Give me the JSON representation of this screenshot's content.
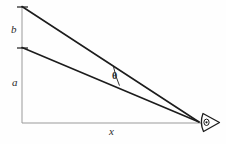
{
  "figure": {
    "kind": "geometry-diagram",
    "background_color": "#fefefe",
    "stroke_color": "#1c1c1c",
    "axis_color": "#8a8a8a",
    "labels": {
      "height_upper": "b",
      "height_lower": "a",
      "horizontal_distance": "x",
      "angle": "θ"
    },
    "icons": {
      "eye": "eye-icon"
    },
    "geometry": {
      "origin": {
        "x": 22,
        "y": 123
      },
      "eye_point": {
        "x": 200,
        "y": 122
      },
      "upper_point": {
        "x": 22,
        "y": 7
      },
      "lower_point": {
        "x": 22,
        "y": 48
      },
      "vertical_axis": {
        "x": 22,
        "y_top": 7,
        "y_bottom": 123
      },
      "horizontal_axis": {
        "y": 123,
        "x_left": 22,
        "x_right": 200
      },
      "angle_arc_center": {
        "x": 200,
        "y": 122
      },
      "angle_arc_radius": 92
    },
    "segments": [
      {
        "name": "sight-line-upper",
        "from": [
          22,
          7
        ],
        "to": [
          200,
          122
        ]
      },
      {
        "name": "sight-line-lower",
        "from": [
          22,
          48
        ],
        "to": [
          200,
          122
        ]
      }
    ],
    "ticks": [
      {
        "name": "tick-upper",
        "x": 22,
        "y": 7
      },
      {
        "name": "tick-lower",
        "x": 22,
        "y": 48
      }
    ]
  }
}
